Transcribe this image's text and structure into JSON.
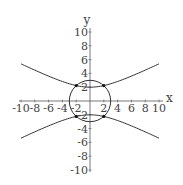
{
  "chart_data": {
    "type": "line",
    "title": "",
    "xlabel": "x",
    "ylabel": "y",
    "xlim": [
      -10,
      10
    ],
    "ylim": [
      -10,
      10
    ],
    "grid": false,
    "legend": null,
    "x_ticks": [
      -10,
      -8,
      -6,
      -4,
      -2,
      2,
      4,
      6,
      8,
      10
    ],
    "x_tick_labels": [
      "-10",
      "-8",
      "-6",
      "-4",
      "-2",
      "2",
      "4",
      "6",
      "8",
      "10"
    ],
    "y_ticks": [
      -10,
      -8,
      -6,
      -4,
      -2,
      2,
      4,
      6,
      8,
      10
    ],
    "y_tick_labels": [
      "-10",
      "-8",
      "-6",
      "-4",
      "-2",
      "2",
      "4",
      "6",
      "8",
      "10"
    ],
    "series": [
      {
        "name": "hyperbola upper branch",
        "equation": "y^2 - x^2/4 = 4 (y>0)",
        "x": [
          -10,
          -8,
          -6,
          -4,
          -2,
          0,
          2,
          4,
          6,
          8,
          10
        ],
        "values": [
          5.39,
          4.47,
          3.61,
          2.83,
          2.24,
          2.0,
          2.24,
          2.83,
          3.61,
          4.47,
          5.39
        ]
      },
      {
        "name": "hyperbola lower branch",
        "equation": "y^2 - x^2/4 = 4 (y<0)",
        "x": [
          -10,
          -8,
          -6,
          -4,
          -2,
          0,
          2,
          4,
          6,
          8,
          10
        ],
        "values": [
          -5.39,
          -4.47,
          -3.61,
          -2.83,
          -2.24,
          -2.0,
          -2.24,
          -2.83,
          -3.61,
          -4.47,
          -5.39
        ]
      },
      {
        "name": "circle",
        "equation": "x^2 + y^2 = 9",
        "radius": 3,
        "center": [
          0,
          0
        ]
      }
    ],
    "points": [
      {
        "x": -2,
        "y": 2.24
      },
      {
        "x": 2,
        "y": 2.24
      },
      {
        "x": -2,
        "y": -2.24
      },
      {
        "x": 2,
        "y": -2.24
      }
    ],
    "colors": {
      "curve": "#333333",
      "axis": "#555555",
      "text": "#444444",
      "point": "#111111"
    }
  }
}
